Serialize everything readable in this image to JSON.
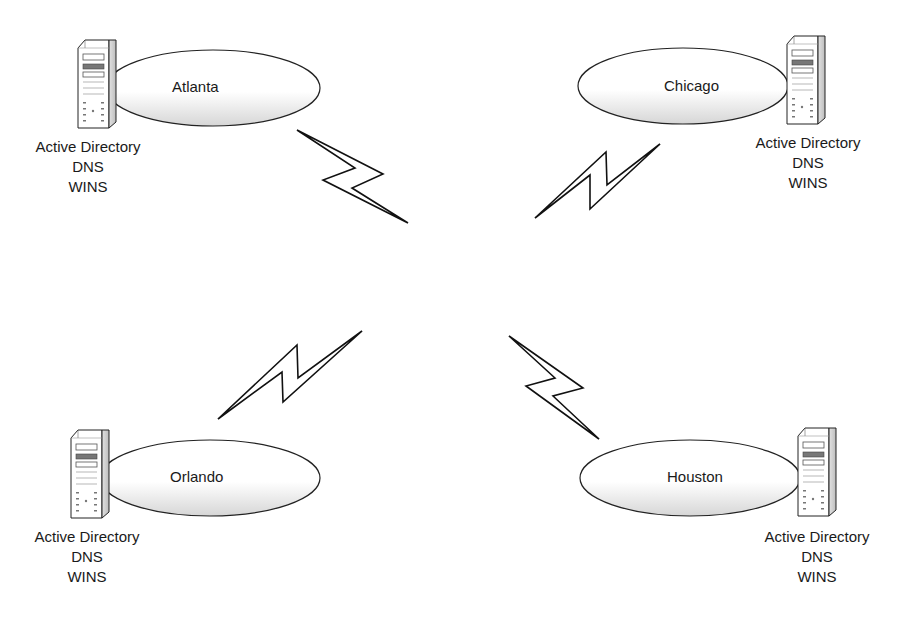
{
  "diagram": {
    "type": "network-topology",
    "wan_center": {
      "x": 470,
      "y": 280
    },
    "colors": {
      "line": "#111111",
      "shading": "#cfcfcf",
      "background": "#ffffff"
    },
    "sites": [
      {
        "id": "atlanta",
        "name": "Atlanta",
        "services": [
          "Active Directory",
          "DNS",
          "WINS"
        ],
        "ellipse": {
          "cx": 213,
          "cy": 88,
          "rx": 107,
          "ry": 38
        },
        "server_side": "left",
        "server": {
          "x": 78,
          "y": 40
        },
        "label": {
          "x": 172,
          "y": 78
        },
        "caption": {
          "x": 18,
          "y": 137
        }
      },
      {
        "id": "chicago",
        "name": "Chicago",
        "services": [
          "Active Directory",
          "DNS",
          "WINS"
        ],
        "ellipse": {
          "cx": 683,
          "cy": 86,
          "rx": 105,
          "ry": 38
        },
        "server_side": "right",
        "server": {
          "x": 787,
          "y": 36
        },
        "label": {
          "x": 664,
          "y": 77
        },
        "caption": {
          "x": 728,
          "y": 133
        }
      },
      {
        "id": "orlando",
        "name": "Orlando",
        "services": [
          "Active Directory",
          "DNS",
          "WINS"
        ],
        "ellipse": {
          "cx": 210,
          "cy": 478,
          "rx": 110,
          "ry": 38
        },
        "server_side": "left",
        "server": {
          "x": 71,
          "y": 430
        },
        "label": {
          "x": 170,
          "y": 468
        },
        "caption": {
          "x": 17,
          "y": 527
        }
      },
      {
        "id": "houston",
        "name": "Houston",
        "services": [
          "Active Directory",
          "DNS",
          "WINS"
        ],
        "ellipse": {
          "cx": 690,
          "cy": 478,
          "rx": 110,
          "ry": 38
        },
        "server_side": "right",
        "server": {
          "x": 798,
          "y": 428
        },
        "label": {
          "x": 667,
          "y": 468
        },
        "caption": {
          "x": 743,
          "y": 527
        }
      }
    ],
    "links": [
      {
        "from": "atlanta",
        "to": "wan",
        "kind": "wan-lightning"
      },
      {
        "from": "chicago",
        "to": "wan",
        "kind": "wan-lightning"
      },
      {
        "from": "orlando",
        "to": "wan",
        "kind": "wan-lightning"
      },
      {
        "from": "houston",
        "to": "wan",
        "kind": "wan-lightning"
      }
    ]
  },
  "sites": {
    "atlanta": {
      "name": "Atlanta",
      "services": [
        "Active Directory",
        "DNS",
        "WINS"
      ]
    },
    "chicago": {
      "name": "Chicago",
      "services": [
        "Active Directory",
        "DNS",
        "WINS"
      ]
    },
    "orlando": {
      "name": "Orlando",
      "services": [
        "Active Directory",
        "DNS",
        "WINS"
      ]
    },
    "houston": {
      "name": "Houston",
      "services": [
        "Active Directory",
        "DNS",
        "WINS"
      ]
    }
  },
  "icons": {
    "server": "server-tower-icon",
    "link": "lightning-bolt-icon",
    "site": "site-ellipse"
  }
}
